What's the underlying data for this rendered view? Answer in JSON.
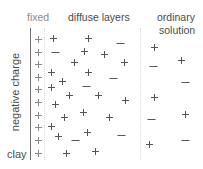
{
  "labels": {
    "fixed": "fixed",
    "diffuse": "diffuse layers",
    "ordinary_line1": "ordinary",
    "ordinary_line2": "solution",
    "negative_charge": "negative charge",
    "clay": "clay"
  },
  "colors": {
    "sign": "#555555",
    "fixed_sign": "#888888",
    "axis": "#6e6e6e",
    "divider": "#dadada"
  },
  "fixed_layer": {
    "sign": "+",
    "y": [
      39,
      52,
      64,
      77,
      89,
      102,
      115,
      127,
      140,
      153
    ],
    "x": 38
  },
  "diffuse_layer": [
    {
      "s": "+",
      "x": 53,
      "y": 38
    },
    {
      "s": "+",
      "x": 88,
      "y": 38
    },
    {
      "s": "-",
      "x": 120,
      "y": 43
    },
    {
      "s": "-",
      "x": 55,
      "y": 52
    },
    {
      "s": "+",
      "x": 84,
      "y": 51
    },
    {
      "s": "+",
      "x": 104,
      "y": 54
    },
    {
      "s": "+",
      "x": 74,
      "y": 62
    },
    {
      "s": "+",
      "x": 124,
      "y": 62
    },
    {
      "s": "+",
      "x": 51,
      "y": 72
    },
    {
      "s": "+",
      "x": 88,
      "y": 72
    },
    {
      "s": "-",
      "x": 113,
      "y": 78
    },
    {
      "s": "+",
      "x": 62,
      "y": 81
    },
    {
      "s": "+",
      "x": 51,
      "y": 87
    },
    {
      "s": "-",
      "x": 86,
      "y": 86
    },
    {
      "s": "+",
      "x": 69,
      "y": 95
    },
    {
      "s": "+",
      "x": 98,
      "y": 95
    },
    {
      "s": "+",
      "x": 125,
      "y": 100
    },
    {
      "s": "+",
      "x": 55,
      "y": 104
    },
    {
      "s": "+",
      "x": 64,
      "y": 117
    },
    {
      "s": "+",
      "x": 83,
      "y": 112
    },
    {
      "s": "+",
      "x": 109,
      "y": 117
    },
    {
      "s": "+",
      "x": 51,
      "y": 126
    },
    {
      "s": "+",
      "x": 58,
      "y": 136
    },
    {
      "s": "-",
      "x": 75,
      "y": 140
    },
    {
      "s": "+",
      "x": 87,
      "y": 132
    },
    {
      "s": "-",
      "x": 121,
      "y": 135
    },
    {
      "s": "+",
      "x": 66,
      "y": 153
    },
    {
      "s": "+",
      "x": 95,
      "y": 151
    }
  ],
  "ordinary_solution": [
    {
      "s": "+",
      "x": 154,
      "y": 47
    },
    {
      "s": "+",
      "x": 181,
      "y": 60
    },
    {
      "s": "-",
      "x": 153,
      "y": 66
    },
    {
      "s": "-",
      "x": 185,
      "y": 82
    },
    {
      "s": "+",
      "x": 154,
      "y": 97
    },
    {
      "s": "+",
      "x": 185,
      "y": 114
    },
    {
      "s": "-",
      "x": 151,
      "y": 119
    },
    {
      "s": "+",
      "x": 149,
      "y": 144
    },
    {
      "s": "-",
      "x": 185,
      "y": 140
    }
  ]
}
